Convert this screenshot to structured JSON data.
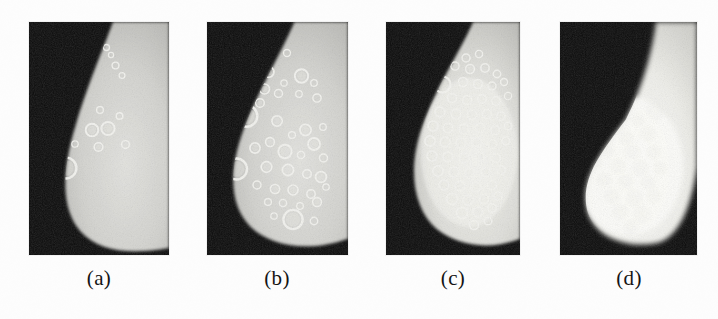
{
  "figure": {
    "kind": "medical-imaging-figure",
    "panel_count": 4,
    "background_color": "#fdfdfd",
    "image_background_color": "#0a0a0a",
    "tissue_color": "#d8d8d4",
    "lesion_color": "#f4f4f0",
    "width": 718,
    "height": 319,
    "panels": [
      {
        "id": "a",
        "caption": "(a)",
        "x": 29,
        "y": 22,
        "w": 140,
        "h": 233,
        "caption_x": 76,
        "caption_y": 268,
        "caption_w": 46,
        "description": "mammogram with sparse ring-shaped lesions",
        "lesion_count": 17,
        "lesions": [
          {
            "cx": 70.5,
            "cy": 18.0,
            "r": 3.6,
            "t": 1.45
          },
          {
            "cx": 77.5,
            "cy": 25.5,
            "r": 3.0,
            "t": 1.3
          },
          {
            "cx": 82.0,
            "cy": 33.0,
            "r": 2.6,
            "t": 1.2
          },
          {
            "cx": 86.5,
            "cy": 43.5,
            "r": 3.4,
            "t": 1.4
          },
          {
            "cx": 49.0,
            "cy": 53.5,
            "r": 3.6,
            "t": 1.3
          },
          {
            "cx": 93.0,
            "cy": 53.5,
            "r": 2.9,
            "t": 1.25
          },
          {
            "cx": 44.5,
            "cy": 75.0,
            "r": 5.2,
            "t": 1.7
          },
          {
            "cx": 71.0,
            "cy": 88.0,
            "r": 3.4,
            "t": 1.3
          },
          {
            "cx": 30.0,
            "cy": 95.5,
            "r": 4.8,
            "t": 1.6
          },
          {
            "cx": 90.5,
            "cy": 94.0,
            "r": 3.3,
            "t": 1.35
          },
          {
            "cx": 22.0,
            "cy": 110.0,
            "r": 4.2,
            "t": 1.5
          },
          {
            "cx": 63.0,
            "cy": 108.0,
            "r": 6.3,
            "t": 1.95
          },
          {
            "cx": 79.0,
            "cy": 106.5,
            "r": 6.6,
            "t": 2.0
          },
          {
            "cx": 46.0,
            "cy": 122.0,
            "r": 3.2,
            "t": 1.3
          },
          {
            "cx": 69.5,
            "cy": 125.0,
            "r": 4.3,
            "t": 1.55
          },
          {
            "cx": 96.5,
            "cy": 122.5,
            "r": 3.9,
            "t": 1.45
          },
          {
            "cx": 37.0,
            "cy": 146.0,
            "r": 10.4,
            "t": 2.45
          }
        ]
      },
      {
        "id": "b",
        "caption": "(b)",
        "x": 207,
        "y": 22,
        "w": 141,
        "h": 233,
        "caption_x": 254,
        "caption_y": 268,
        "caption_w": 46,
        "description": "mammogram with moderate density of ring-shaped lesions",
        "lesion_count": 38,
        "lesions": [
          {
            "cx": 80.0,
            "cy": 31.0,
            "r": 3.5,
            "t": 1.35
          },
          {
            "cx": 61.5,
            "cy": 50.0,
            "r": 5.4,
            "t": 1.7
          },
          {
            "cx": 94.5,
            "cy": 54.0,
            "r": 6.7,
            "t": 1.9
          },
          {
            "cx": 107.0,
            "cy": 61.0,
            "r": 3.3,
            "t": 1.3
          },
          {
            "cx": 77.0,
            "cy": 61.0,
            "r": 3.2,
            "t": 1.25
          },
          {
            "cx": 57.5,
            "cy": 67.0,
            "r": 5.0,
            "t": 1.6
          },
          {
            "cx": 71.5,
            "cy": 71.5,
            "r": 4.0,
            "t": 1.45
          },
          {
            "cx": 92.0,
            "cy": 72.0,
            "r": 3.3,
            "t": 1.25
          },
          {
            "cx": 110.0,
            "cy": 76.0,
            "r": 4.1,
            "t": 1.45
          },
          {
            "cx": 53.0,
            "cy": 81.0,
            "r": 4.3,
            "t": 1.5
          },
          {
            "cx": 39.5,
            "cy": 94.0,
            "r": 10.8,
            "t": 2.45
          },
          {
            "cx": 70.0,
            "cy": 99.0,
            "r": 5.2,
            "t": 1.65
          },
          {
            "cx": 98.5,
            "cy": 108.0,
            "r": 5.6,
            "t": 1.75
          },
          {
            "cx": 116.0,
            "cy": 105.0,
            "r": 3.3,
            "t": 1.25
          },
          {
            "cx": 85.0,
            "cy": 113.0,
            "r": 3.4,
            "t": 1.3
          },
          {
            "cx": 107.0,
            "cy": 122.0,
            "r": 6.0,
            "t": 1.8
          },
          {
            "cx": 63.0,
            "cy": 120.0,
            "r": 4.4,
            "t": 1.55
          },
          {
            "cx": 48.0,
            "cy": 126.0,
            "r": 5.1,
            "t": 1.65
          },
          {
            "cx": 78.0,
            "cy": 129.5,
            "r": 6.7,
            "t": 1.95
          },
          {
            "cx": 94.0,
            "cy": 133.0,
            "r": 3.6,
            "t": 1.35
          },
          {
            "cx": 116.5,
            "cy": 136.0,
            "r": 4.0,
            "t": 1.45
          },
          {
            "cx": 29.5,
            "cy": 147.0,
            "r": 10.5,
            "t": 2.4
          },
          {
            "cx": 59.5,
            "cy": 145.0,
            "r": 5.3,
            "t": 1.7
          },
          {
            "cx": 81.0,
            "cy": 148.0,
            "r": 5.6,
            "t": 1.75
          },
          {
            "cx": 100.0,
            "cy": 152.0,
            "r": 4.2,
            "t": 1.5
          },
          {
            "cx": 114.0,
            "cy": 155.0,
            "r": 5.4,
            "t": 1.7
          },
          {
            "cx": 50.0,
            "cy": 163.0,
            "r": 4.0,
            "t": 1.45
          },
          {
            "cx": 68.0,
            "cy": 167.0,
            "r": 4.6,
            "t": 1.55
          },
          {
            "cx": 86.0,
            "cy": 168.0,
            "r": 5.0,
            "t": 1.6
          },
          {
            "cx": 104.0,
            "cy": 172.0,
            "r": 4.2,
            "t": 1.5
          },
          {
            "cx": 61.0,
            "cy": 180.0,
            "r": 3.4,
            "t": 1.3
          },
          {
            "cx": 76.0,
            "cy": 181.0,
            "r": 3.6,
            "t": 1.35
          },
          {
            "cx": 93.0,
            "cy": 184.0,
            "r": 3.3,
            "t": 1.25
          },
          {
            "cx": 110.0,
            "cy": 180.0,
            "r": 4.4,
            "t": 1.55
          },
          {
            "cx": 67.0,
            "cy": 194.0,
            "r": 3.2,
            "t": 1.25
          },
          {
            "cx": 86.0,
            "cy": 197.5,
            "r": 9.6,
            "t": 2.3
          },
          {
            "cx": 107.0,
            "cy": 199.0,
            "r": 3.7,
            "t": 1.4
          },
          {
            "cx": 119.0,
            "cy": 165.0,
            "r": 3.2,
            "t": 1.25
          }
        ]
      },
      {
        "id": "c",
        "caption": "(c)",
        "x": 386,
        "y": 22,
        "w": 134,
        "h": 233,
        "caption_x": 430,
        "caption_y": 268,
        "caption_w": 46,
        "description": "mammogram with dense confluent ring-shaped lesions",
        "lesion_count": 56,
        "lesions": [
          {
            "cx": 80.0,
            "cy": 36.0,
            "r": 4.0,
            "t": 1.45
          },
          {
            "cx": 93.0,
            "cy": 32.0,
            "r": 3.6,
            "t": 1.4
          },
          {
            "cx": 69.0,
            "cy": 44.0,
            "r": 4.1,
            "t": 1.45
          },
          {
            "cx": 84.0,
            "cy": 47.0,
            "r": 4.4,
            "t": 1.5
          },
          {
            "cx": 99.0,
            "cy": 46.0,
            "r": 4.2,
            "t": 1.45
          },
          {
            "cx": 111.0,
            "cy": 52.0,
            "r": 3.7,
            "t": 1.4
          },
          {
            "cx": 56.5,
            "cy": 62.5,
            "r": 8.0,
            "t": 2.1
          },
          {
            "cx": 77.0,
            "cy": 60.0,
            "r": 4.6,
            "t": 1.55
          },
          {
            "cx": 92.0,
            "cy": 62.0,
            "r": 4.4,
            "t": 1.5
          },
          {
            "cx": 106.0,
            "cy": 64.0,
            "r": 4.0,
            "t": 1.45
          },
          {
            "cx": 118.0,
            "cy": 60.0,
            "r": 3.5,
            "t": 1.35
          },
          {
            "cx": 66.0,
            "cy": 76.0,
            "r": 4.6,
            "t": 1.55
          },
          {
            "cx": 81.0,
            "cy": 78.0,
            "r": 4.5,
            "t": 1.5
          },
          {
            "cx": 96.0,
            "cy": 77.0,
            "r": 4.3,
            "t": 1.5
          },
          {
            "cx": 110.0,
            "cy": 79.0,
            "r": 4.2,
            "t": 1.45
          },
          {
            "cx": 122.0,
            "cy": 74.0,
            "r": 3.6,
            "t": 1.35
          },
          {
            "cx": 54.0,
            "cy": 90.0,
            "r": 5.0,
            "t": 1.6
          },
          {
            "cx": 70.0,
            "cy": 92.0,
            "r": 4.8,
            "t": 1.6
          },
          {
            "cx": 86.0,
            "cy": 93.0,
            "r": 4.7,
            "t": 1.55
          },
          {
            "cx": 101.0,
            "cy": 92.0,
            "r": 4.5,
            "t": 1.5
          },
          {
            "cx": 115.0,
            "cy": 94.0,
            "r": 4.1,
            "t": 1.45
          },
          {
            "cx": 47.0,
            "cy": 104.0,
            "r": 5.0,
            "t": 1.6
          },
          {
            "cx": 62.0,
            "cy": 106.0,
            "r": 4.8,
            "t": 1.6
          },
          {
            "cx": 78.0,
            "cy": 107.0,
            "r": 4.9,
            "t": 1.6
          },
          {
            "cx": 94.0,
            "cy": 106.0,
            "r": 4.7,
            "t": 1.55
          },
          {
            "cx": 109.0,
            "cy": 108.0,
            "r": 4.4,
            "t": 1.5
          },
          {
            "cx": 122.0,
            "cy": 104.0,
            "r": 3.8,
            "t": 1.4
          },
          {
            "cx": 44.0,
            "cy": 119.0,
            "r": 5.1,
            "t": 1.65
          },
          {
            "cx": 59.0,
            "cy": 120.0,
            "r": 4.9,
            "t": 1.6
          },
          {
            "cx": 75.0,
            "cy": 121.0,
            "r": 5.0,
            "t": 1.6
          },
          {
            "cx": 91.0,
            "cy": 120.0,
            "r": 4.8,
            "t": 1.6
          },
          {
            "cx": 106.0,
            "cy": 122.0,
            "r": 4.5,
            "t": 1.5
          },
          {
            "cx": 120.0,
            "cy": 119.0,
            "r": 4.0,
            "t": 1.45
          },
          {
            "cx": 46.0,
            "cy": 134.0,
            "r": 5.0,
            "t": 1.6
          },
          {
            "cx": 62.0,
            "cy": 135.0,
            "r": 4.9,
            "t": 1.6
          },
          {
            "cx": 78.0,
            "cy": 136.0,
            "r": 5.0,
            "t": 1.6
          },
          {
            "cx": 94.0,
            "cy": 135.0,
            "r": 4.8,
            "t": 1.6
          },
          {
            "cx": 110.0,
            "cy": 136.0,
            "r": 4.5,
            "t": 1.5
          },
          {
            "cx": 52.0,
            "cy": 149.0,
            "r": 5.2,
            "t": 1.65
          },
          {
            "cx": 68.0,
            "cy": 150.0,
            "r": 5.0,
            "t": 1.6
          },
          {
            "cx": 84.0,
            "cy": 151.0,
            "r": 4.9,
            "t": 1.6
          },
          {
            "cx": 100.0,
            "cy": 150.0,
            "r": 4.7,
            "t": 1.55
          },
          {
            "cx": 115.0,
            "cy": 148.0,
            "r": 4.2,
            "t": 1.45
          },
          {
            "cx": 58.0,
            "cy": 163.0,
            "r": 5.0,
            "t": 1.6
          },
          {
            "cx": 74.0,
            "cy": 164.0,
            "r": 4.9,
            "t": 1.6
          },
          {
            "cx": 90.0,
            "cy": 165.0,
            "r": 4.8,
            "t": 1.6
          },
          {
            "cx": 106.0,
            "cy": 163.0,
            "r": 4.5,
            "t": 1.5
          },
          {
            "cx": 66.0,
            "cy": 177.0,
            "r": 5.4,
            "t": 1.7
          },
          {
            "cx": 82.0,
            "cy": 178.0,
            "r": 5.1,
            "t": 1.65
          },
          {
            "cx": 98.0,
            "cy": 177.0,
            "r": 4.7,
            "t": 1.55
          },
          {
            "cx": 112.0,
            "cy": 174.0,
            "r": 4.0,
            "t": 1.45
          },
          {
            "cx": 76.0,
            "cy": 191.0,
            "r": 5.6,
            "t": 1.75
          },
          {
            "cx": 92.0,
            "cy": 190.0,
            "r": 5.0,
            "t": 1.6
          },
          {
            "cx": 106.0,
            "cy": 186.0,
            "r": 4.2,
            "t": 1.45
          },
          {
            "cx": 88.0,
            "cy": 203.0,
            "r": 4.4,
            "t": 1.5
          },
          {
            "cx": 102.0,
            "cy": 199.0,
            "r": 3.8,
            "t": 1.4
          }
        ]
      },
      {
        "id": "d",
        "caption": "(d)",
        "x": 560,
        "y": 22,
        "w": 137,
        "h": 233,
        "caption_x": 606,
        "caption_y": 268,
        "caption_w": 46,
        "description": "mammogram with merged saturated lesion mass, faint ring outlines",
        "lesion_count": 22,
        "lesions": [
          {
            "cx": 96.0,
            "cy": 88.0,
            "r": 9.0,
            "t": 1.7
          },
          {
            "cx": 78.0,
            "cy": 98.0,
            "r": 6.0,
            "t": 1.2
          },
          {
            "cx": 56.0,
            "cy": 104.0,
            "r": 6.5,
            "t": 1.1
          },
          {
            "cx": 40.0,
            "cy": 114.0,
            "r": 6.0,
            "t": 1.0
          },
          {
            "cx": 66.0,
            "cy": 116.0,
            "r": 7.0,
            "t": 1.1
          },
          {
            "cx": 88.0,
            "cy": 112.0,
            "r": 7.5,
            "t": 1.2
          },
          {
            "cx": 48.0,
            "cy": 128.0,
            "r": 6.5,
            "t": 1.05
          },
          {
            "cx": 72.0,
            "cy": 130.0,
            "r": 7.5,
            "t": 1.15
          },
          {
            "cx": 94.0,
            "cy": 130.0,
            "r": 6.5,
            "t": 1.1
          },
          {
            "cx": 36.0,
            "cy": 141.0,
            "r": 6.0,
            "t": 1.0
          },
          {
            "cx": 58.0,
            "cy": 144.0,
            "r": 7.5,
            "t": 1.15
          },
          {
            "cx": 80.0,
            "cy": 146.0,
            "r": 8.0,
            "t": 1.25
          },
          {
            "cx": 100.0,
            "cy": 146.0,
            "r": 6.0,
            "t": 1.05
          },
          {
            "cx": 44.0,
            "cy": 158.0,
            "r": 7.0,
            "t": 1.1
          },
          {
            "cx": 66.0,
            "cy": 160.0,
            "r": 7.5,
            "t": 1.15
          },
          {
            "cx": 88.0,
            "cy": 161.0,
            "r": 7.0,
            "t": 1.1
          },
          {
            "cx": 52.0,
            "cy": 174.0,
            "r": 7.5,
            "t": 1.2
          },
          {
            "cx": 74.0,
            "cy": 176.0,
            "r": 8.0,
            "t": 1.25
          },
          {
            "cx": 94.0,
            "cy": 174.0,
            "r": 6.5,
            "t": 1.1
          },
          {
            "cx": 60.0,
            "cy": 190.0,
            "r": 7.5,
            "t": 1.25
          },
          {
            "cx": 82.0,
            "cy": 192.0,
            "r": 8.0,
            "t": 1.3
          },
          {
            "cx": 71.0,
            "cy": 205.0,
            "r": 7.0,
            "t": 1.2
          }
        ]
      }
    ]
  }
}
